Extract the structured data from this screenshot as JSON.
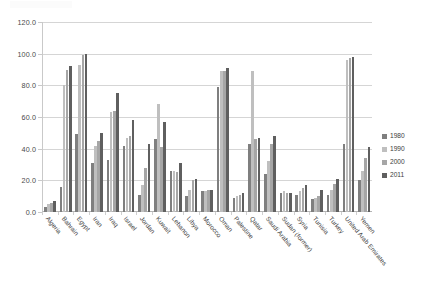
{
  "chart": {
    "type": "bar",
    "title": "",
    "xlabel": "",
    "ylabel": ""
  },
  "legend": {
    "position": "right",
    "entries": [
      {
        "label": "1980",
        "color": "#7f7f7f"
      },
      {
        "label": "1990",
        "color": "#bfbfbf"
      },
      {
        "label": "2000",
        "color": "#a6a6a6"
      },
      {
        "label": "2011",
        "color": "#5f5f5f"
      }
    ]
  },
  "yaxis": {
    "min": 0,
    "max": 120,
    "step": 20,
    "ticks": [
      "0.0",
      "20.0",
      "40.0",
      "60.0",
      "80.0",
      "100.0",
      "120.0"
    ]
  },
  "chart_data": {
    "type": "bar",
    "title": "",
    "xlabel": "",
    "ylabel": "",
    "ylim": [
      0,
      120
    ],
    "yticks": [
      0,
      20,
      40,
      60,
      80,
      100,
      120
    ],
    "grid": true,
    "legend_position": "right",
    "categories": [
      "Algeria",
      "Bahrain",
      "Egypt",
      "Iran",
      "Iraq",
      "Israel",
      "Jordan",
      "Kuwait",
      "Lebanon",
      "Libya",
      "Morocco",
      "Oman",
      "Palestine",
      "Qatar",
      "Saudi Arabia",
      "Sudan (former)",
      "Syria",
      "Tunisia",
      "Turkey",
      "United Arab Emirates",
      "Yemen"
    ],
    "series": [
      {
        "name": "1980",
        "color": "#7f7f7f",
        "values": [
          3,
          16,
          49,
          31,
          33,
          42,
          11,
          46,
          26,
          10,
          13,
          79,
          9,
          43,
          24,
          12,
          11,
          8,
          11,
          43,
          20
        ]
      },
      {
        "name": "1990",
        "color": "#bfbfbf",
        "values": [
          5,
          80,
          93,
          42,
          63,
          47,
          17,
          68,
          26,
          14,
          13,
          89,
          10,
          89,
          32,
          13,
          13,
          9,
          14,
          96,
          26
        ]
      },
      {
        "name": "2000",
        "color": "#a6a6a6",
        "values": [
          6,
          90,
          99,
          45,
          64,
          48,
          28,
          41,
          25,
          20,
          14,
          89,
          11,
          46,
          43,
          12,
          15,
          10,
          18,
          97,
          34
        ]
      },
      {
        "name": "2011",
        "color": "#5f5f5f",
        "values": [
          7,
          92,
          100,
          50,
          75,
          58,
          43,
          57,
          31,
          21,
          14,
          91,
          12,
          47,
          48,
          12,
          17,
          14,
          21,
          98,
          41
        ]
      }
    ]
  }
}
